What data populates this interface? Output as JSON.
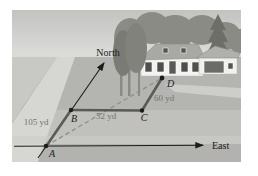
{
  "figure": {
    "compass": {
      "north": "North",
      "east": "East"
    },
    "points": {
      "a": "A",
      "b": "B",
      "c": "C",
      "d": "D"
    },
    "distances": {
      "ab": "105 yd",
      "bc": "52 yd",
      "cd": "60 yd"
    },
    "colors": {
      "axis": "#1c1c1c",
      "segment": "#5a5a58",
      "dashed_path": "#8e8e8a",
      "distance_label": "#757571",
      "point_label": "#1c1c1c"
    }
  }
}
